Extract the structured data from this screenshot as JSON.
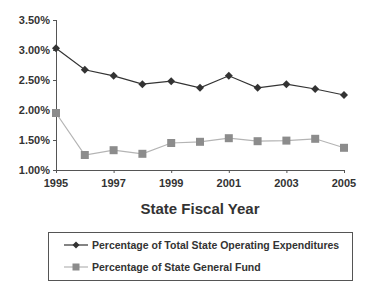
{
  "chart_data": {
    "type": "line",
    "title": "",
    "xlabel": "State Fiscal Year",
    "ylabel": "",
    "x": [
      1995,
      1996,
      1997,
      1998,
      1999,
      2000,
      2001,
      2002,
      2003,
      2004,
      2005
    ],
    "x_tick_labels": [
      "1995",
      "1997",
      "1999",
      "2001",
      "2003",
      "2005"
    ],
    "y_tick_labels": [
      "1.00%",
      "1.50%",
      "2.00%",
      "2.50%",
      "3.00%",
      "3.50%"
    ],
    "ylim": [
      1.0,
      3.5
    ],
    "grid": false,
    "legend_position": "bottom",
    "series": [
      {
        "name": "Percentage of Total State Operating Expenditures",
        "marker": "diamond",
        "color": "#333333",
        "values": [
          3.03,
          2.67,
          2.57,
          2.43,
          2.48,
          2.37,
          2.57,
          2.37,
          2.43,
          2.35,
          2.25
        ]
      },
      {
        "name": "Percentage of State General Fund",
        "marker": "square",
        "color": "#8c8c8c",
        "line_color": "#b4b4b4",
        "values": [
          1.95,
          1.25,
          1.33,
          1.27,
          1.45,
          1.47,
          1.53,
          1.48,
          1.49,
          1.52,
          1.37
        ]
      }
    ]
  }
}
